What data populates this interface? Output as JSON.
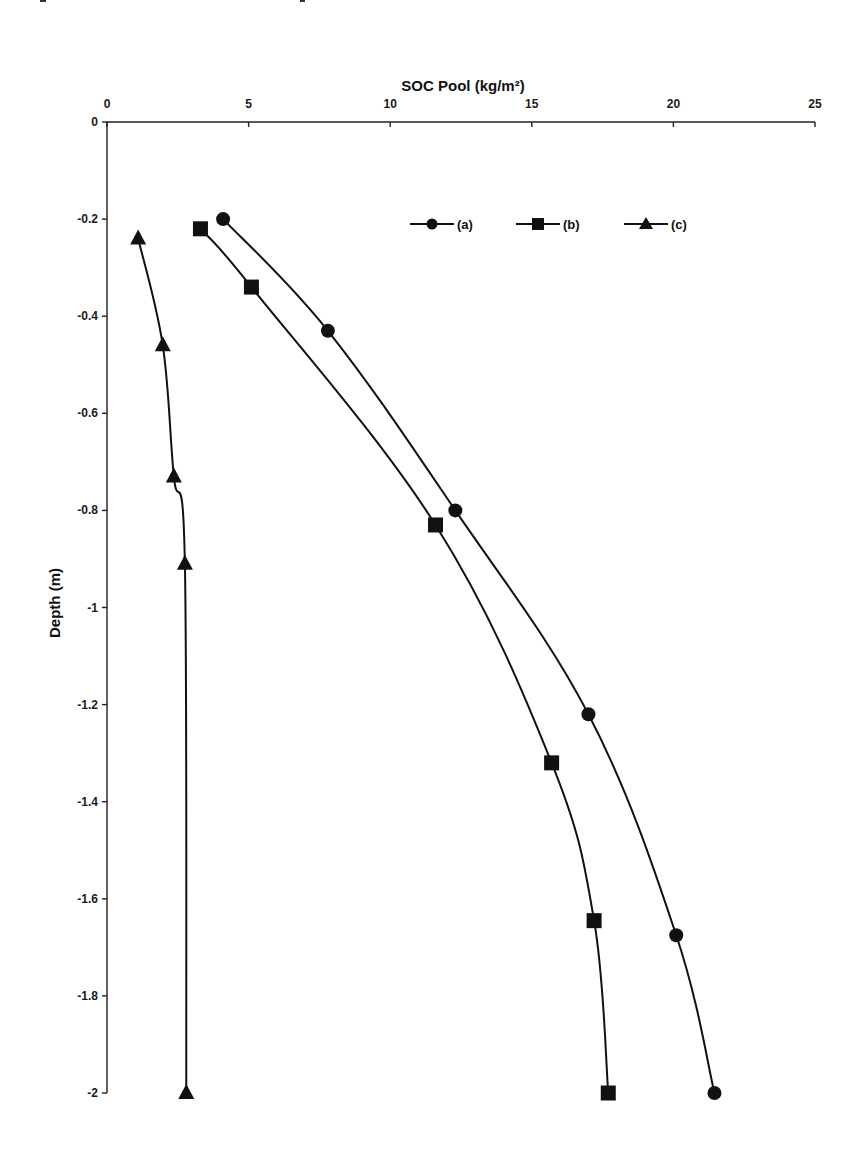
{
  "chart_data": {
    "type": "line",
    "title": "",
    "xlabel": "SOC Pool (kg/m²)",
    "ylabel": "Depth (m)",
    "xlim": [
      0,
      25
    ],
    "ylim": [
      -2,
      0
    ],
    "x_axis_position": "top",
    "x_ticks": [
      "0",
      "5",
      "10",
      "15",
      "20",
      "25"
    ],
    "y_ticks": [
      "0",
      "-0.2",
      "-0.4",
      "-0.6",
      "-0.8",
      "-1",
      "-1.2",
      "-1.4",
      "-1.6",
      "-1.8",
      "-2"
    ],
    "grid": false,
    "legend_position": "top-right inside",
    "series": [
      {
        "name": "(a)",
        "marker": "circle",
        "points": [
          {
            "x": 4.1,
            "y": -0.2
          },
          {
            "x": 7.8,
            "y": -0.43
          },
          {
            "x": 12.3,
            "y": -0.8
          },
          {
            "x": 17.0,
            "y": -1.22
          },
          {
            "x": 20.1,
            "y": -1.675
          },
          {
            "x": 21.45,
            "y": -2.0
          }
        ]
      },
      {
        "name": "(b)",
        "marker": "square",
        "points": [
          {
            "x": 3.3,
            "y": -0.22
          },
          {
            "x": 5.1,
            "y": -0.34
          },
          {
            "x": 11.6,
            "y": -0.83
          },
          {
            "x": 15.7,
            "y": -1.32
          },
          {
            "x": 17.2,
            "y": -1.645
          },
          {
            "x": 17.7,
            "y": -2.0
          }
        ]
      },
      {
        "name": "(c)",
        "marker": "triangle",
        "points": [
          {
            "x": 1.1,
            "y": -0.24
          },
          {
            "x": 1.97,
            "y": -0.46
          },
          {
            "x": 2.36,
            "y": -0.73
          },
          {
            "x": 2.75,
            "y": -0.91
          },
          {
            "x": 2.8,
            "y": -2.0
          }
        ]
      }
    ]
  },
  "legend": {
    "items": [
      {
        "label": "(a)",
        "marker": "circle"
      },
      {
        "label": "(b)",
        "marker": "square"
      },
      {
        "label": "(c)",
        "marker": "triangle"
      }
    ]
  },
  "colors": {
    "series": "#111111",
    "axis": "#222222",
    "background": "#ffffff"
  }
}
